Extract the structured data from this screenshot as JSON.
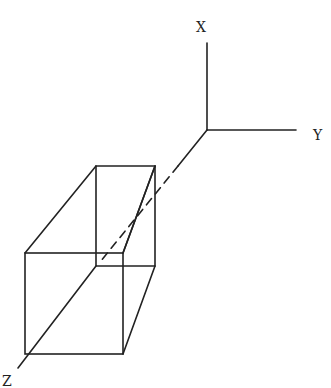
{
  "diagram": {
    "type": "3d-axes-with-box",
    "axes": {
      "x": {
        "label": "X",
        "direction": "up"
      },
      "y": {
        "label": "Y",
        "direction": "right"
      },
      "z": {
        "label": "Z",
        "direction": "down-left"
      }
    },
    "box": {
      "description": "rectangular prism along Z axis, hidden edge shown dashed"
    },
    "stroke_color": "#222222",
    "background": "#ffffff"
  }
}
